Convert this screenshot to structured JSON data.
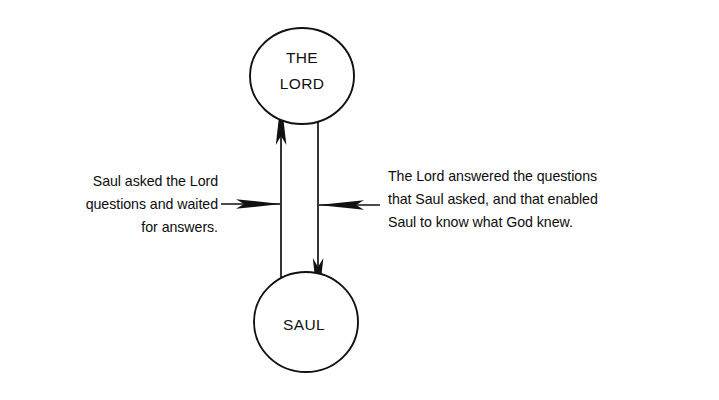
{
  "canvas": {
    "width": 719,
    "height": 400,
    "background": "#ffffff",
    "ink": "#111111"
  },
  "diagram": {
    "type": "node-edge-diagram",
    "title": "",
    "nodes": [
      {
        "id": "the-lord",
        "shape": "ellipse",
        "label_line1": "THE",
        "label_line2": "LORD",
        "cx": 302,
        "cy": 76,
        "rx": 52,
        "ry": 48
      },
      {
        "id": "saul",
        "shape": "ellipse",
        "label_line1": "SAUL",
        "label_line2": "",
        "cx": 306,
        "cy": 322,
        "rx": 52,
        "ry": 50
      }
    ],
    "edges": [
      {
        "id": "saul-to-the-lord",
        "from": "saul",
        "to": "the-lord",
        "direction": "up",
        "x": 281
      },
      {
        "id": "the-lord-to-saul",
        "from": "the-lord",
        "to": "saul",
        "direction": "down",
        "x": 318
      }
    ],
    "annotations": [
      {
        "id": "left-annotation",
        "align": "left",
        "points_to": "saul-to-the-lord",
        "lines": [
          "Saul asked the Lord",
          "questions and waited",
          "for answers."
        ]
      },
      {
        "id": "right-annotation",
        "align": "right",
        "points_to": "the-lord-to-saul",
        "lines": [
          "The Lord answered the questions",
          "that Saul asked, and that enabled",
          "Saul to know what God knew."
        ]
      }
    ]
  }
}
